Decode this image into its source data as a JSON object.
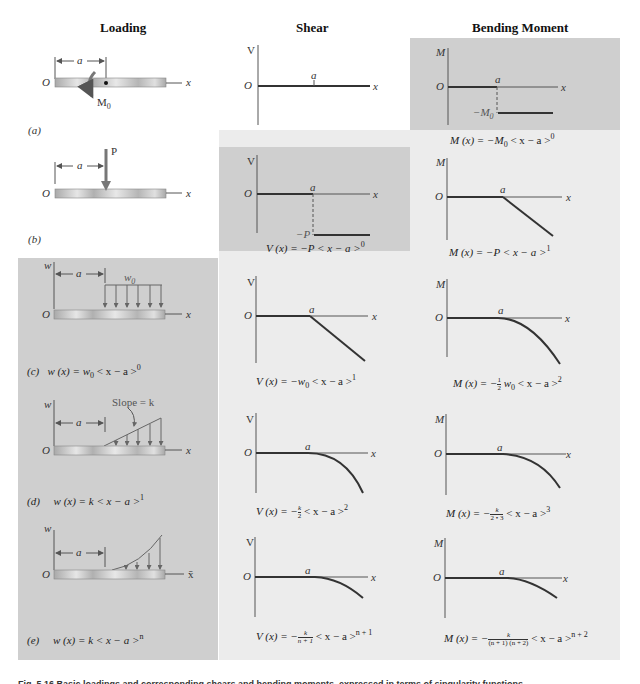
{
  "headers": {
    "loading": "Loading",
    "shear": "Shear",
    "moment": "Bending Moment"
  },
  "colors": {
    "dark_panel": "#cfcfcf",
    "light_panel": "#ececec",
    "beam": "#b8b8b8",
    "curve": "#333333"
  },
  "cases": [
    {
      "id": "a",
      "tag": "(a)",
      "loading": {
        "type": "couple",
        "load_label": "M0",
        "dim_label": "a",
        "origin": "O",
        "axis": "x",
        "equation": ""
      },
      "shear": {
        "axis_v": "V",
        "origin": "O",
        "axis_x": "x",
        "a_label": "a",
        "equation": ""
      },
      "moment": {
        "axis_m": "M",
        "origin": "O",
        "axis_x": "x",
        "a_label": "a",
        "level_label": "−M0",
        "equation": "M (x) = −M0 < x − a >^0"
      }
    },
    {
      "id": "b",
      "tag": "(b)",
      "loading": {
        "type": "point",
        "load_label": "P",
        "dim_label": "a",
        "origin": "O",
        "axis": "x",
        "equation": ""
      },
      "shear": {
        "axis_v": "V",
        "origin": "O",
        "axis_x": "x",
        "a_label": "a",
        "level_label": "−P",
        "equation": "V (x) = −P < x − a >^0"
      },
      "moment": {
        "axis_m": "M",
        "origin": "O",
        "axis_x": "x",
        "a_label": "a",
        "equation": "M (x) = −P < x − a >^1"
      }
    },
    {
      "id": "c",
      "tag": "(c)",
      "loading": {
        "type": "uniform",
        "load_label": "w0",
        "axis_w": "w",
        "dim_label": "a",
        "origin": "O",
        "axis": "x",
        "equation": "w (x) = w0 < x − a >^0"
      },
      "shear": {
        "axis_v": "V",
        "origin": "O",
        "axis_x": "x",
        "a_label": "a",
        "equation": "V (x) = −w0 < x − a >^1"
      },
      "moment": {
        "axis_m": "M",
        "origin": "O",
        "axis_x": "x",
        "a_label": "a",
        "equation": "M (x) = −½ w0 < x − a >^2"
      }
    },
    {
      "id": "d",
      "tag": "(d)",
      "loading": {
        "type": "linear",
        "load_label": "Slope = k",
        "axis_w": "w",
        "dim_label": "a",
        "origin": "O",
        "axis": "x",
        "equation": "w (x) = k < x − a >^1"
      },
      "shear": {
        "axis_v": "V",
        "origin": "O",
        "axis_x": "x",
        "a_label": "a",
        "equation": "V (x) = −k/2 < x − a >^2"
      },
      "moment": {
        "axis_m": "M",
        "origin": "O",
        "axis_x": "x",
        "a_label": "a",
        "equation": "M (x) = −k/(2·3) < x − a >^3"
      }
    },
    {
      "id": "e",
      "tag": "(e)",
      "loading": {
        "type": "power",
        "load_label": "",
        "axis_w": "w",
        "dim_label": "a",
        "origin": "O",
        "axis": "x̄",
        "equation": "w (x) = k < x − a >^n"
      },
      "shear": {
        "axis_v": "V",
        "origin": "O",
        "axis_x": "x",
        "a_label": "a",
        "equation": "V (x) = −k/(n+1) < x − a >^(n+1)"
      },
      "moment": {
        "axis_m": "M",
        "origin": "O",
        "axis_x": "x",
        "a_label": "a",
        "equation": "M (x) = −k/((n+1)(n+2)) < x − a >^(n+2)"
      }
    }
  ],
  "text": {
    "M0": "M",
    "sub0": "0",
    "negM0": "−M",
    "negP": "−P",
    "w0": "w",
    "slope": "Slope = k",
    "eq_a_m": {
      "pre": "M (x) = −M",
      "sub": "0",
      "mid": " < x − a >",
      "sup": "0"
    },
    "eq_b_v": {
      "pre": "V (x) = −P < x − a >",
      "sup": "0"
    },
    "eq_b_m": {
      "pre": "M (x) = −P < x − a >",
      "sup": "1"
    },
    "eq_c_w": {
      "tag": "(c)",
      "pre": "w (x) = w",
      "sub": "0",
      "mid": " < x − a >",
      "sup": "0"
    },
    "eq_c_v": {
      "pre": "V (x) = −w",
      "sub": "0",
      "mid": " < x − a >",
      "sup": "1"
    },
    "eq_c_m": {
      "pre": "M (x) = −",
      "num": "1",
      "den": "2",
      "post": " w",
      "sub": "0",
      "mid": " < x − a >",
      "sup": "2"
    },
    "eq_d_w": {
      "tag": "(d)",
      "pre": "w (x) = k < x − a >",
      "sup": "1"
    },
    "eq_d_v": {
      "pre": "V (x) = −",
      "num": "k",
      "den": "2",
      "mid": " < x − a >",
      "sup": "2"
    },
    "eq_d_m": {
      "pre": "M (x) = −",
      "num": "k",
      "den": "2 • 3",
      "mid": " < x − a >",
      "sup": "3"
    },
    "eq_e_w": {
      "tag": "(e)",
      "pre": "w (x) = k < x − a >",
      "sup": "n"
    },
    "eq_e_v": {
      "pre": "V (x) = −",
      "num": "k",
      "den": "n + 1",
      "mid": " < x − a >",
      "sup": "n + 1"
    },
    "eq_e_m": {
      "pre": "M (x) = −",
      "num": "k",
      "den": "(n + 1) (n + 2)",
      "mid": " < x − a >",
      "sup": "n + 2"
    },
    "tag_a": "(a)",
    "tag_b": "(b)",
    "caption": "Fig. 5.16  Basic loadings and corresponding shears and bending moments, expressed in terms of singularity functions."
  }
}
